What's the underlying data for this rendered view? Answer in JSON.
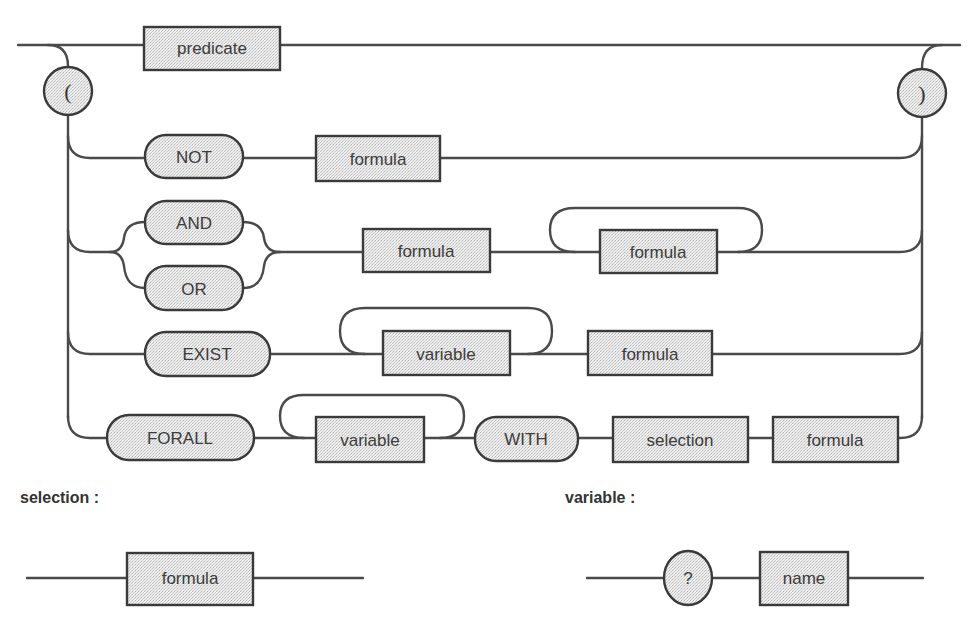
{
  "diagram": {
    "colors": {
      "line": "#4a4a4a",
      "node_fill": "#e6e6e6",
      "node_stroke": "#3a3a3a",
      "text": "#3c3c3c",
      "background": "#ffffff"
    },
    "main": {
      "open_paren": "(",
      "close_paren": ")",
      "predicate": "predicate",
      "rows": {
        "not": {
          "keyword": "NOT",
          "operand": "formula"
        },
        "and_or": {
          "keywords": [
            "AND",
            "OR"
          ],
          "first": "formula",
          "repeat": "formula"
        },
        "exist": {
          "keyword": "EXIST",
          "repeat": "variable",
          "operand": "formula"
        },
        "forall": {
          "keyword": "FORALL",
          "repeat": "variable",
          "with": "WITH",
          "selection": "selection",
          "operand": "formula"
        }
      }
    },
    "selection_rule": {
      "label": "selection :",
      "node": "formula"
    },
    "variable_rule": {
      "label": "variable :",
      "prefix": "?",
      "node": "name"
    }
  }
}
